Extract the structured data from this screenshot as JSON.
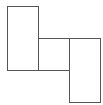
{
  "diagram": {
    "stroke": "#555555",
    "fill": "#ffffff",
    "shapes": [
      {
        "name": "left-tall-rect",
        "x": 7.5,
        "y": 6.5,
        "w": 31,
        "h": 64
      },
      {
        "name": "middle-square",
        "x": 38.5,
        "y": 38.5,
        "w": 31,
        "h": 32
      },
      {
        "name": "right-tall-rect",
        "x": 69.5,
        "y": 38.5,
        "w": 31,
        "h": 64
      }
    ]
  }
}
